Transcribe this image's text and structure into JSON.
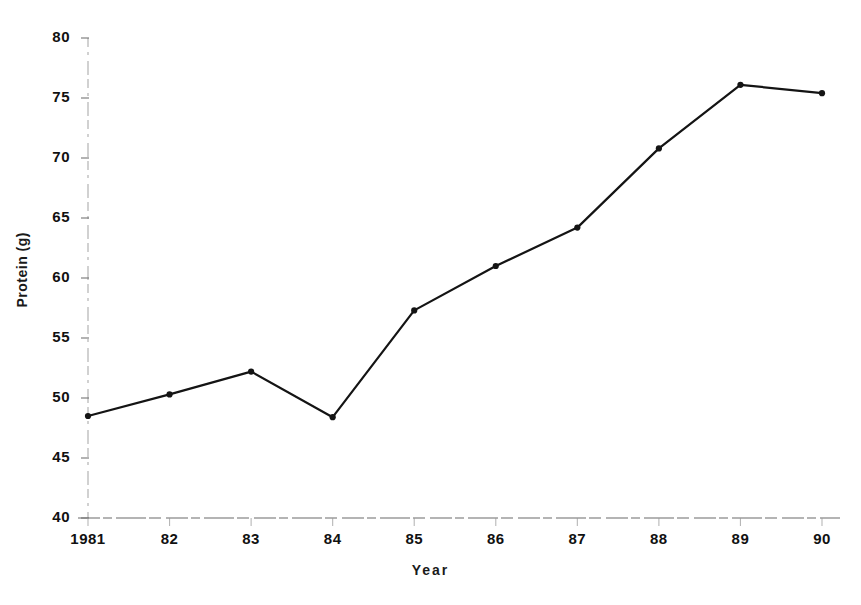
{
  "chart_data": {
    "type": "line",
    "title": "",
    "xlabel": "Year",
    "ylabel": "Protein (g)",
    "categories": [
      "1981",
      "82",
      "83",
      "84",
      "85",
      "86",
      "87",
      "88",
      "89",
      "90"
    ],
    "x": [
      1981,
      1982,
      1983,
      1984,
      1985,
      1986,
      1987,
      1988,
      1989,
      1990
    ],
    "values": [
      48.5,
      50.3,
      52.2,
      48.4,
      57.3,
      61.0,
      64.2,
      70.8,
      76.1,
      75.4
    ],
    "ylim": [
      40,
      80
    ],
    "yticks": [
      40,
      45,
      50,
      55,
      60,
      65,
      70,
      75,
      80
    ],
    "ytick_labels": [
      "40",
      "45",
      "50",
      "55",
      "60",
      "65",
      "70",
      "75",
      "80"
    ],
    "grid": false,
    "legend": null,
    "series_color": "#141414",
    "marker": "circle",
    "axis_color": "#9a9a9a"
  },
  "figure": {
    "background": "#ffffff",
    "axis_style": "dashed-scanned"
  }
}
